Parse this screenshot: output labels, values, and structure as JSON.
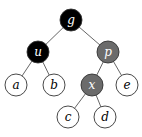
{
  "diagram": {
    "type": "binary-tree",
    "radius": 11,
    "nodes": [
      {
        "id": "g",
        "label": "g",
        "x": 71,
        "y": 20,
        "fill": "#000000",
        "text": "#ffffff"
      },
      {
        "id": "u",
        "label": "u",
        "x": 38,
        "y": 52,
        "fill": "#000000",
        "text": "#ffffff"
      },
      {
        "id": "p",
        "label": "p",
        "x": 108,
        "y": 52,
        "fill": "#6b6b6b",
        "text": "#ffffff"
      },
      {
        "id": "a",
        "label": "a",
        "x": 16,
        "y": 85,
        "fill": "#ffffff",
        "text": "#000000"
      },
      {
        "id": "b",
        "label": "b",
        "x": 54,
        "y": 85,
        "fill": "#ffffff",
        "text": "#000000"
      },
      {
        "id": "x",
        "label": "x",
        "x": 92,
        "y": 85,
        "fill": "#6b6b6b",
        "text": "#ffffff"
      },
      {
        "id": "e",
        "label": "e",
        "x": 127,
        "y": 85,
        "fill": "#ffffff",
        "text": "#000000"
      },
      {
        "id": "c",
        "label": "c",
        "x": 68,
        "y": 117,
        "fill": "#ffffff",
        "text": "#000000"
      },
      {
        "id": "d",
        "label": "d",
        "x": 105,
        "y": 117,
        "fill": "#ffffff",
        "text": "#000000"
      }
    ],
    "edges": [
      [
        "g",
        "u"
      ],
      [
        "g",
        "p"
      ],
      [
        "u",
        "a"
      ],
      [
        "u",
        "b"
      ],
      [
        "p",
        "x"
      ],
      [
        "p",
        "e"
      ],
      [
        "x",
        "c"
      ],
      [
        "x",
        "d"
      ]
    ]
  }
}
